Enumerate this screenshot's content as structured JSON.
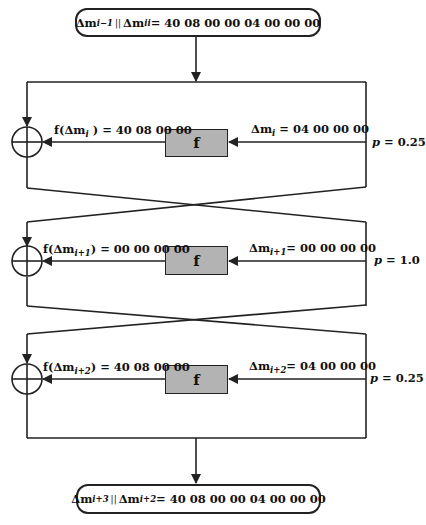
{
  "diagram": {
    "type": "feistel-differential-trail",
    "colors": {
      "line": "#222222",
      "f_box_fill": "#b3b3b3",
      "background": "#ffffff"
    },
    "input_terminal": {
      "left_var": "Δm",
      "left_sub": "i−1",
      "sep": "||",
      "right_var": "Δm",
      "right_sub": "ii",
      "value": "= 40 08 00 00 04 00 00 00"
    },
    "rounds": [
      {
        "f_label": "f",
        "input_var": "Δm",
        "input_sub": "i",
        "input_value": "= 04 00 00 00",
        "output_prefix": "f(Δm",
        "output_sub": "i",
        "output_suffix": " ) = 40 08 00 00",
        "probability_var": "p",
        "probability_value": "= 0.25"
      },
      {
        "f_label": "f",
        "input_var": "Δm",
        "input_sub": "i+1",
        "input_value": "= 00 00 00 00",
        "output_prefix": "f(Δm",
        "output_sub": "i+1",
        "output_suffix": ") = 00 00 00 00",
        "probability_var": "p",
        "probability_value": "= 1.0"
      },
      {
        "f_label": "f",
        "input_var": "Δm",
        "input_sub": "i+2",
        "input_value": "= 04 00 00 00",
        "output_prefix": "f(Δm",
        "output_sub": "i+2",
        "output_suffix": ") = 40 08 00 00",
        "probability_var": "p",
        "probability_value": "= 0.25"
      }
    ],
    "output_terminal": {
      "left_var": "Δm",
      "left_sub": "i+3",
      "sep": "||",
      "right_var": "Δm",
      "right_sub": "i+2",
      "value": "= 40 08 00 00 04 00 00 00"
    }
  }
}
